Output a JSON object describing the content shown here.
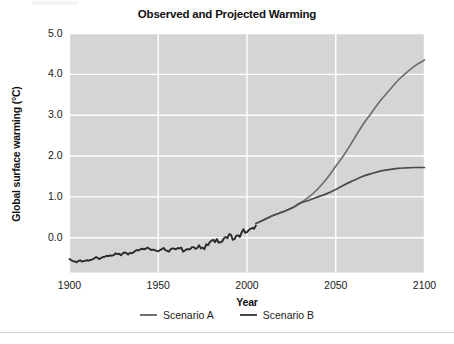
{
  "chart_data": {
    "type": "line",
    "title": "Observed and Projected Warming",
    "xlabel": "Year",
    "ylabel": "Global surface warming (°C)",
    "xlim": [
      1900,
      2100
    ],
    "ylim": [
      -0.85,
      5.0
    ],
    "xticks": [
      1900,
      1950,
      2000,
      2050,
      2100
    ],
    "xtick_labels": [
      "1900",
      "1950",
      "2000",
      "2050",
      "2100"
    ],
    "yticks": [
      0.0,
      1.0,
      2.0,
      3.0,
      4.0,
      5.0
    ],
    "ytick_labels": [
      "0.0",
      "1.0",
      "2.0",
      "3.0",
      "4.0",
      "5.0"
    ],
    "grid": true,
    "grid_color": "#ffffff",
    "plot_background": "#d5d5d5",
    "legend_position": "bottom",
    "series": [
      {
        "name": "Scenario A",
        "color": "#6f6f6f",
        "x": [
          2005,
          2010,
          2015,
          2020,
          2025,
          2030,
          2035,
          2040,
          2045,
          2050,
          2055,
          2060,
          2065,
          2070,
          2075,
          2080,
          2085,
          2090,
          2095,
          2100
        ],
        "values": [
          0.35,
          0.45,
          0.55,
          0.63,
          0.72,
          0.85,
          1.0,
          1.2,
          1.45,
          1.75,
          2.05,
          2.4,
          2.75,
          3.05,
          3.35,
          3.6,
          3.85,
          4.05,
          4.22,
          4.35
        ]
      },
      {
        "name": "Scenario B",
        "color": "#4a4a4a",
        "x": [
          2005,
          2010,
          2015,
          2020,
          2025,
          2030,
          2035,
          2040,
          2045,
          2050,
          2055,
          2060,
          2065,
          2070,
          2075,
          2080,
          2085,
          2090,
          2095,
          2100
        ],
        "values": [
          0.35,
          0.45,
          0.55,
          0.63,
          0.72,
          0.85,
          0.92,
          1.0,
          1.08,
          1.18,
          1.3,
          1.4,
          1.5,
          1.57,
          1.63,
          1.67,
          1.7,
          1.71,
          1.72,
          1.72
        ]
      },
      {
        "name": "Observed",
        "color": "#2b2b2b",
        "x": [
          1900,
          1901,
          1902,
          1903,
          1904,
          1905,
          1906,
          1907,
          1908,
          1909,
          1910,
          1911,
          1912,
          1913,
          1914,
          1915,
          1916,
          1917,
          1918,
          1919,
          1920,
          1921,
          1922,
          1923,
          1924,
          1925,
          1926,
          1927,
          1928,
          1929,
          1930,
          1931,
          1932,
          1933,
          1934,
          1935,
          1936,
          1937,
          1938,
          1939,
          1940,
          1941,
          1942,
          1943,
          1944,
          1945,
          1946,
          1947,
          1948,
          1949,
          1950,
          1951,
          1952,
          1953,
          1954,
          1955,
          1956,
          1957,
          1958,
          1959,
          1960,
          1961,
          1962,
          1963,
          1964,
          1965,
          1966,
          1967,
          1968,
          1969,
          1970,
          1971,
          1972,
          1973,
          1974,
          1975,
          1976,
          1977,
          1978,
          1979,
          1980,
          1981,
          1982,
          1983,
          1984,
          1985,
          1986,
          1987,
          1988,
          1989,
          1990,
          1991,
          1992,
          1993,
          1994,
          1995,
          1996,
          1997,
          1998,
          1999,
          2000,
          2001,
          2002,
          2003,
          2004,
          2005
        ],
        "values": [
          -0.52,
          -0.55,
          -0.57,
          -0.58,
          -0.6,
          -0.57,
          -0.55,
          -0.58,
          -0.57,
          -0.56,
          -0.55,
          -0.56,
          -0.54,
          -0.53,
          -0.5,
          -0.47,
          -0.5,
          -0.52,
          -0.49,
          -0.47,
          -0.46,
          -0.44,
          -0.45,
          -0.43,
          -0.44,
          -0.42,
          -0.38,
          -0.4,
          -0.39,
          -0.43,
          -0.38,
          -0.36,
          -0.37,
          -0.41,
          -0.37,
          -0.38,
          -0.36,
          -0.32,
          -0.3,
          -0.31,
          -0.28,
          -0.27,
          -0.28,
          -0.27,
          -0.24,
          -0.27,
          -0.3,
          -0.29,
          -0.3,
          -0.32,
          -0.33,
          -0.3,
          -0.28,
          -0.25,
          -0.3,
          -0.32,
          -0.34,
          -0.28,
          -0.26,
          -0.27,
          -0.28,
          -0.25,
          -0.26,
          -0.24,
          -0.34,
          -0.31,
          -0.28,
          -0.28,
          -0.28,
          -0.23,
          -0.23,
          -0.27,
          -0.25,
          -0.18,
          -0.26,
          -0.24,
          -0.28,
          -0.16,
          -0.18,
          -0.11,
          -0.07,
          -0.05,
          -0.11,
          -0.03,
          -0.12,
          -0.11,
          -0.09,
          -0.01,
          0.02,
          -0.01,
          0.09,
          0.07,
          -0.05,
          -0.03,
          0.05,
          0.06,
          0.02,
          0.13,
          0.21,
          0.12,
          0.14,
          0.19,
          0.22,
          0.24,
          0.22,
          0.3
        ]
      }
    ],
    "annotations": {
      "divergence_year": 2030,
      "divergence_value": 0.85,
      "scenario_a_2100": 4.35,
      "scenario_b_2100": 1.72,
      "observed_start_year": 1900,
      "observed_start_value": -0.52
    }
  },
  "legend": {
    "entries": [
      {
        "label": "Scenario A",
        "color": "#6f6f6f"
      },
      {
        "label": "Scenario B",
        "color": "#4a4a4a"
      }
    ]
  }
}
